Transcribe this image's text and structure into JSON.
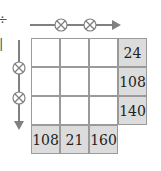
{
  "puzzle": {
    "operation": "multiply",
    "operator_symbol": "×",
    "grid_size": 3,
    "cells": [
      [
        "",
        "",
        ""
      ],
      [
        "",
        "",
        ""
      ],
      [
        "",
        "",
        ""
      ]
    ],
    "row_products": [
      "24",
      "108",
      "140"
    ],
    "column_products": [
      "108",
      "21",
      "160"
    ]
  },
  "arrows": {
    "horizontal": {
      "direction": "right",
      "operators": [
        "×",
        "×"
      ]
    },
    "vertical": {
      "direction": "down",
      "operators": [
        "×",
        "×"
      ]
    }
  },
  "colors": {
    "shaded_cell": "#dcdcdc",
    "grid_line": "#9a9a9a",
    "arrow": "#808080"
  },
  "edge_fragments": [
    "÷",
    "‖"
  ]
}
